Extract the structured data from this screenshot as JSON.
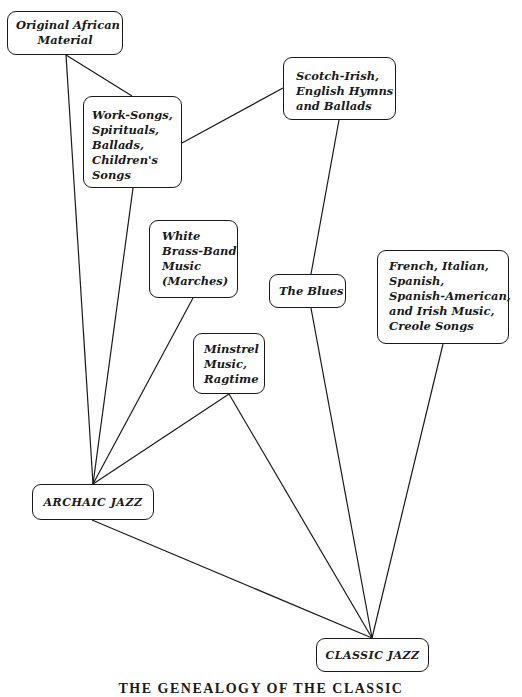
{
  "diagram": {
    "caption": "THE GENEALOGY OF THE CLASSIC",
    "nodes": {
      "african": {
        "lines": [
          "Original African",
          "Material"
        ]
      },
      "work": {
        "lines": [
          "Work-Songs,",
          "Spirituals,",
          "Ballads,",
          "Children's",
          "Songs"
        ]
      },
      "scotch": {
        "lines": [
          "Scotch-Irish,",
          "English Hymns",
          "and Ballads"
        ]
      },
      "white": {
        "lines": [
          "White",
          "Brass-Band",
          "Music",
          "(Marches)"
        ]
      },
      "blues": {
        "lines": [
          "The Blues"
        ]
      },
      "french": {
        "lines": [
          "French, Italian,",
          "Spanish,",
          "Spanish-American,",
          "and Irish Music,",
          "Creole Songs"
        ]
      },
      "minstrel": {
        "lines": [
          "Minstrel",
          "Music,",
          "Ragtime"
        ]
      },
      "archaic": {
        "lines": [
          "ARCHAIC JAZZ"
        ]
      },
      "classic": {
        "lines": [
          "CLASSIC JAZZ"
        ]
      }
    },
    "edges": [
      {
        "from": "Original African Material",
        "to": "ARCHAIC JAZZ"
      },
      {
        "from": "Original African Material",
        "to": "Work-Songs, Spirituals, Ballads, Children's Songs"
      },
      {
        "from": "Work-Songs, Spirituals, Ballads, Children's Songs",
        "to": "Scotch-Irish, English Hymns and Ballads"
      },
      {
        "from": "Work-Songs, Spirituals, Ballads, Children's Songs",
        "to": "ARCHAIC JAZZ"
      },
      {
        "from": "Scotch-Irish, English Hymns and Ballads",
        "to": "The Blues"
      },
      {
        "from": "White Brass-Band Music (Marches)",
        "to": "ARCHAIC JAZZ"
      },
      {
        "from": "Minstrel Music, Ragtime",
        "to": "ARCHAIC JAZZ"
      },
      {
        "from": "Minstrel Music, Ragtime",
        "to": "CLASSIC JAZZ"
      },
      {
        "from": "The Blues",
        "to": "CLASSIC JAZZ"
      },
      {
        "from": "French, Italian, Spanish, Spanish-American, and Irish Music, Creole Songs",
        "to": "CLASSIC JAZZ"
      },
      {
        "from": "ARCHAIC JAZZ",
        "to": "CLASSIC JAZZ"
      }
    ]
  }
}
